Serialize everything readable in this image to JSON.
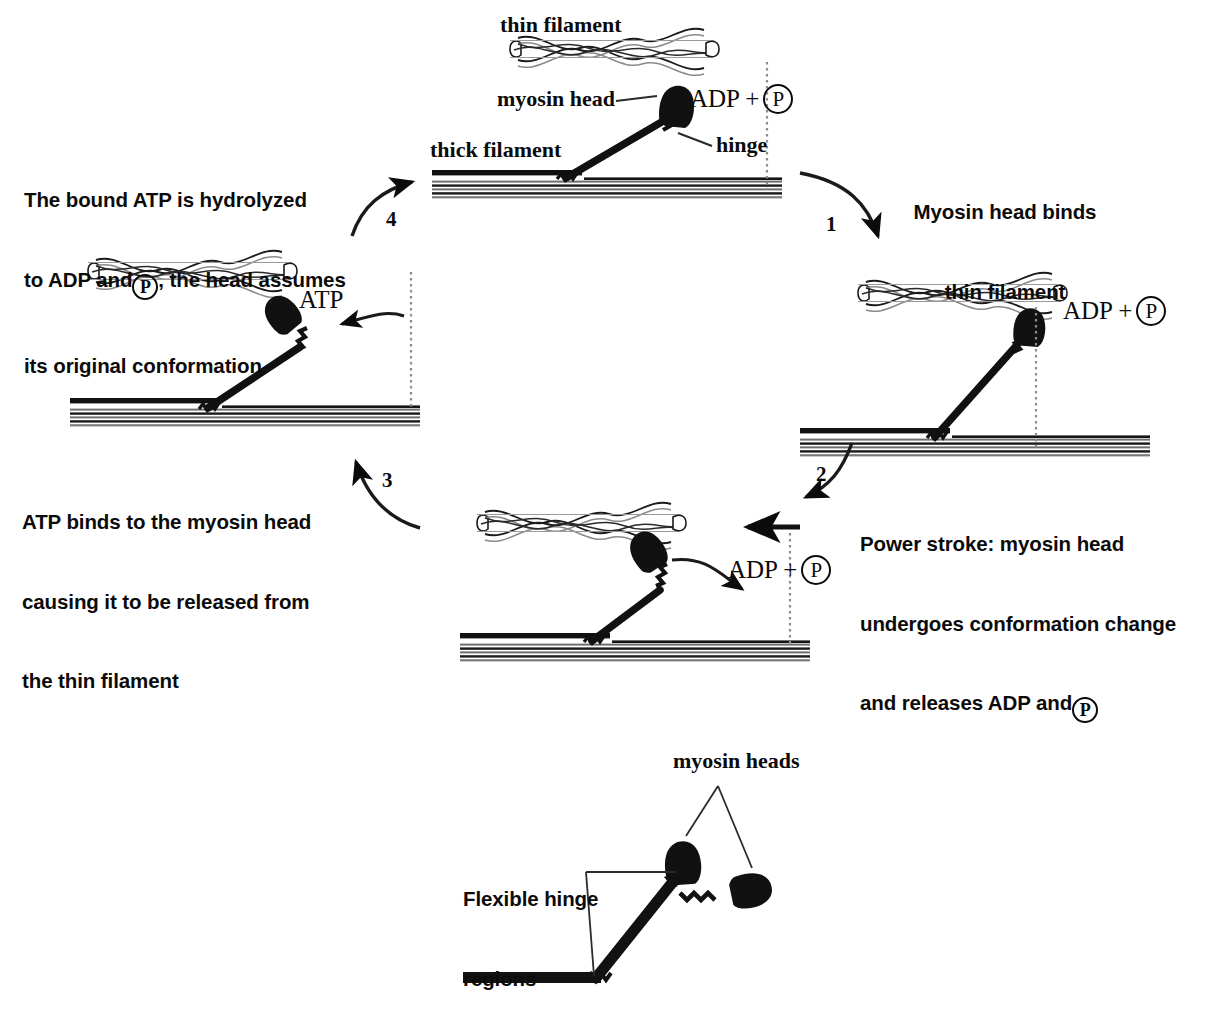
{
  "figure": {
    "ink_color": "#0b0b0b",
    "background_color": "#ffffff"
  },
  "top_panel": {
    "thin_filament_label": "thin filament",
    "myosin_head_label": "myosin head",
    "thick_filament_label": "thick filament",
    "hinge_label": "hinge",
    "adp_prefix": "ADP +",
    "p_symbol": "P"
  },
  "steps": [
    {
      "number": "1",
      "lines": [
        "Myosin head binds",
        "thin filament"
      ],
      "align": "center"
    },
    {
      "number": "2",
      "lines": [
        "Power stroke: myosin head",
        "undergoes conformation change",
        "and releases ADP and"
      ],
      "align": "left",
      "trailing_p": "P"
    },
    {
      "number": "3",
      "lines": [
        "ATP binds to the myosin head",
        "causing it to be released from",
        "the thin filament"
      ],
      "align": "left"
    },
    {
      "number": "4",
      "lines_before_p": [
        "The bound ATP is hydrolyzed",
        "to ADP and"
      ],
      "p_symbol": "P",
      "line_after_p": ", the head assumes",
      "last_line": "its original conformation",
      "align": "left"
    }
  ],
  "panel_labels": {
    "state1_adp": "ADP +",
    "state1_p": "P",
    "state2_adp": "ADP +",
    "state2_p": "P",
    "state3_atp": "ATP"
  },
  "bottom_panel": {
    "myosin_heads_label": "myosin heads",
    "flexible_hinge_line1": "Flexible hinge",
    "flexible_hinge_line2": "regions"
  }
}
